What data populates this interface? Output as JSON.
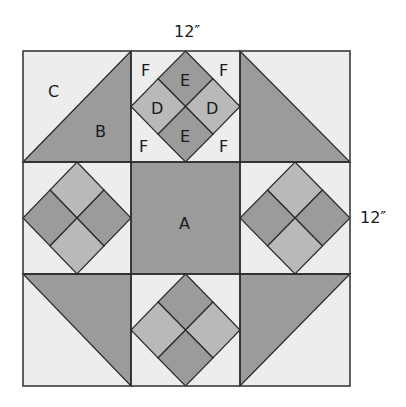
{
  "diagram": {
    "dimensions": {
      "width_label": "12″",
      "height_label": "12″"
    },
    "colors": {
      "background": "#ededed",
      "dark": "#9b9b9b",
      "medium": "#b9b9b9",
      "line": "#2a2a2a"
    },
    "piece_labels": {
      "A": "A",
      "B": "B",
      "C": "C",
      "D": "D",
      "E": "E",
      "F": "F"
    },
    "pieces": [
      {
        "id": "A",
        "description": "center square",
        "color": "dark"
      },
      {
        "id": "B",
        "description": "large triangle",
        "color": "dark"
      },
      {
        "id": "C",
        "description": "background triangle",
        "color": "background"
      },
      {
        "id": "D",
        "description": "small square (light)",
        "color": "medium"
      },
      {
        "id": "E",
        "description": "small square (dark)",
        "color": "dark"
      },
      {
        "id": "F",
        "description": "corner background triangle",
        "color": "background"
      }
    ]
  }
}
